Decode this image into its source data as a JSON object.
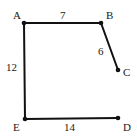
{
  "diagram": {
    "type": "polyline-figure",
    "cropped_top_text": "",
    "line_color": "#111111",
    "vertices": [
      {
        "id": "A",
        "label": "A",
        "x": 24,
        "y": 23,
        "label_x": 13,
        "label_y": 19
      },
      {
        "id": "B",
        "label": "B",
        "x": 101,
        "y": 23,
        "label_x": 106,
        "label_y": 19
      },
      {
        "id": "C",
        "label": "C",
        "x": 118,
        "y": 70,
        "label_x": 123,
        "label_y": 76
      },
      {
        "id": "D",
        "label": "D",
        "x": 118,
        "y": 118,
        "label_x": 123,
        "label_y": 131
      },
      {
        "id": "E",
        "label": "E",
        "x": 25,
        "y": 119,
        "label_x": 13,
        "label_y": 131
      }
    ],
    "edges": [
      {
        "from": "A",
        "to": "B",
        "length": "7",
        "label_x": 60,
        "label_y": 19
      },
      {
        "from": "B",
        "to": "C",
        "length": "6",
        "label_x": 98,
        "label_y": 55
      },
      {
        "from": "A",
        "to": "E",
        "length": "12",
        "label_x": 6,
        "label_y": 71
      },
      {
        "from": "E",
        "to": "D",
        "length": "14",
        "label_x": 64,
        "label_y": 131
      }
    ]
  }
}
